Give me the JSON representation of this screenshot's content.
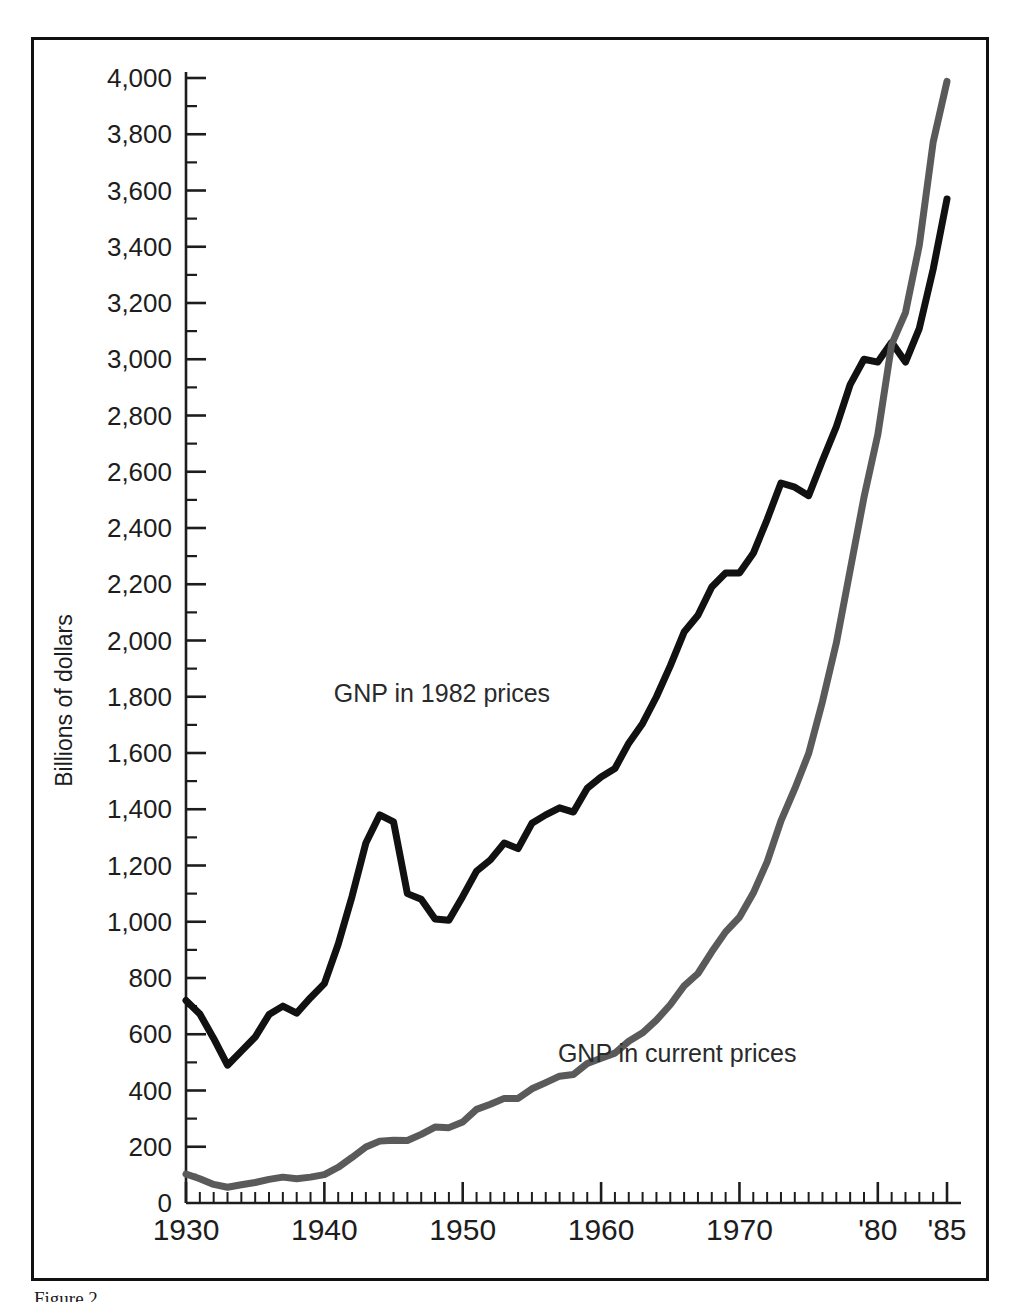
{
  "figure": {
    "caption": "Figure 2",
    "background_color": "#ffffff",
    "frame_color": "#111111"
  },
  "chart_data": {
    "type": "line",
    "title": "",
    "subtitle": "",
    "xlabel": "",
    "ylabel": "Billions of dollars",
    "xlim": [
      1930,
      1985
    ],
    "ylim": [
      0,
      4000
    ],
    "grid": false,
    "legend_position": "inline-annotation",
    "x_tick_labels": [
      "1930",
      "1940",
      "1950",
      "1960",
      "1970",
      "'80",
      "'85"
    ],
    "x_tick_values": [
      1930,
      1940,
      1950,
      1960,
      1970,
      1980,
      1985
    ],
    "x_minor_tick_step": 1,
    "y_tick_labels": [
      "0",
      "200",
      "400",
      "600",
      "800",
      "1,000",
      "1,200",
      "1,400",
      "1,600",
      "1,800",
      "2,000",
      "2,200",
      "2,400",
      "2,600",
      "2,800",
      "3,000",
      "3,200",
      "3,400",
      "3,600",
      "3,800",
      "4,000"
    ],
    "y_tick_values": [
      0,
      200,
      400,
      600,
      800,
      1000,
      1200,
      1400,
      1600,
      1800,
      2000,
      2200,
      2400,
      2600,
      2800,
      3000,
      3200,
      3400,
      3600,
      3800,
      4000
    ],
    "y_minor_tick_step": 100,
    "x": [
      1930,
      1931,
      1932,
      1933,
      1934,
      1935,
      1936,
      1937,
      1938,
      1939,
      1940,
      1941,
      1942,
      1943,
      1944,
      1945,
      1946,
      1947,
      1948,
      1949,
      1950,
      1951,
      1952,
      1953,
      1954,
      1955,
      1956,
      1957,
      1958,
      1959,
      1960,
      1961,
      1962,
      1963,
      1964,
      1965,
      1966,
      1967,
      1968,
      1969,
      1970,
      1971,
      1972,
      1973,
      1974,
      1975,
      1976,
      1977,
      1978,
      1979,
      1980,
      1981,
      1982,
      1983,
      1984,
      1985
    ],
    "series": [
      {
        "name": "GNP in 1982 prices",
        "color": "#111111",
        "line_width": 7,
        "label_text": "GNP in 1982 prices",
        "values": [
          720,
          672,
          585,
          490,
          540,
          590,
          670,
          700,
          675,
          730,
          780,
          920,
          1090,
          1280,
          1380,
          1355,
          1100,
          1080,
          1010,
          1005,
          1090,
          1180,
          1220,
          1280,
          1260,
          1350,
          1380,
          1405,
          1390,
          1475,
          1515,
          1545,
          1635,
          1705,
          1800,
          1910,
          2030,
          2090,
          2190,
          2240,
          2240,
          2310,
          2430,
          2560,
          2545,
          2515,
          2640,
          2760,
          2910,
          3000,
          2990,
          3060,
          2990,
          3110,
          3320,
          3570
        ]
      },
      {
        "name": "GNP in current prices",
        "color": "#5a5a5a",
        "line_width": 7,
        "label_text": "GNP in current prices",
        "values": [
          103,
          86,
          66,
          56,
          65,
          73,
          84,
          92,
          86,
          92,
          101,
          127,
          162,
          199,
          220,
          223,
          222,
          244,
          270,
          268,
          288,
          333,
          351,
          372,
          372,
          406,
          428,
          451,
          457,
          496,
          515,
          533,
          575,
          605,
          650,
          705,
          772,
          816,
          893,
          964,
          1016,
          1102,
          1213,
          1359,
          1473,
          1598,
          1783,
          1991,
          2250,
          2509,
          2732,
          3053,
          3166,
          3406,
          3772,
          3988
        ]
      }
    ],
    "annotations": [
      {
        "text": "GNP in 1982 prices",
        "x": 1948.5,
        "y": 1780
      },
      {
        "text": "GNP in current prices",
        "x": 1965.5,
        "y": 500
      }
    ]
  }
}
